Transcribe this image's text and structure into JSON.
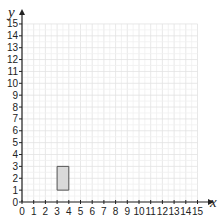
{
  "chart_data": {
    "type": "scatter",
    "title": "",
    "xlabel": "x",
    "ylabel": "y",
    "xlim": [
      0,
      15
    ],
    "ylim": [
      0,
      15
    ],
    "grid": true,
    "x_ticks": [
      0,
      1,
      2,
      3,
      4,
      5,
      6,
      7,
      8,
      9,
      10,
      11,
      12,
      13,
      14,
      15
    ],
    "y_ticks": [
      0,
      1,
      2,
      3,
      4,
      5,
      6,
      7,
      8,
      9,
      10,
      11,
      12,
      13,
      14,
      15
    ],
    "shapes": [
      {
        "type": "rectangle",
        "vertices": [
          [
            3,
            1
          ],
          [
            4,
            1
          ],
          [
            4,
            3
          ],
          [
            3,
            3
          ]
        ],
        "fill": "#d9d9d9",
        "stroke": "#555555"
      }
    ]
  },
  "colors": {
    "grid": "#e2e2e2",
    "axis": "#222222",
    "shape_fill": "#d9d9d9",
    "shape_stroke": "#555555"
  }
}
